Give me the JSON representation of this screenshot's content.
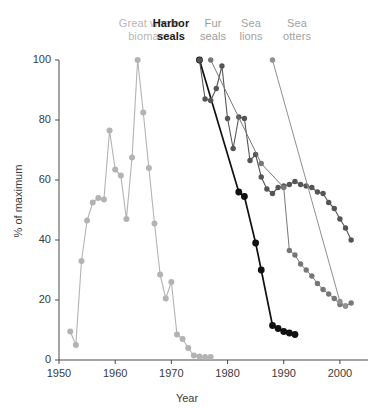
{
  "chart_data": {
    "type": "line",
    "title": "",
    "xlabel": "Year",
    "ylabel": "% of maximum",
    "xlim": [
      1950,
      2005
    ],
    "ylim": [
      0,
      100
    ],
    "xticks": [
      1950,
      1960,
      1970,
      1980,
      1990,
      2000
    ],
    "yticks": [
      0,
      20,
      40,
      60,
      80,
      100
    ],
    "grid": false,
    "legend_position": "top-inside",
    "series": [
      {
        "name": "Great whale biomass",
        "color": "#b3b3b3",
        "label_color": "#b3b3b3",
        "points": [
          [
            1952,
            9.5
          ],
          [
            1953,
            5.0
          ],
          [
            1954,
            33.0
          ],
          [
            1955,
            46.5
          ],
          [
            1956,
            52.5
          ],
          [
            1957,
            54.0
          ],
          [
            1958,
            53.5
          ],
          [
            1959,
            76.5
          ],
          [
            1960,
            63.5
          ],
          [
            1961,
            61.5
          ],
          [
            1962,
            47.0
          ],
          [
            1963,
            67.5
          ],
          [
            1964,
            100.0
          ],
          [
            1965,
            82.5
          ],
          [
            1966,
            64.0
          ],
          [
            1967,
            45.5
          ],
          [
            1968,
            28.5
          ],
          [
            1969,
            20.5
          ],
          [
            1970,
            26.0
          ],
          [
            1971,
            8.5
          ],
          [
            1972,
            7.0
          ],
          [
            1973,
            4.0
          ],
          [
            1974,
            1.5
          ],
          [
            1975,
            1.2
          ],
          [
            1976,
            1.0
          ],
          [
            1977,
            1.0
          ]
        ]
      },
      {
        "name": "Harbor seals",
        "color": "#111111",
        "label_color": "#1a1a1a",
        "points": [
          [
            1975,
            100.0
          ],
          [
            1982,
            56.0
          ],
          [
            1983,
            54.5
          ],
          [
            1985,
            39.0
          ],
          [
            1986,
            30.0
          ],
          [
            1988,
            11.5
          ],
          [
            1989,
            10.5
          ],
          [
            1990,
            9.5
          ],
          [
            1991,
            9.0
          ],
          [
            1992,
            8.5
          ]
        ]
      },
      {
        "name": "Fur seals",
        "color": "#555555",
        "label_color": "#9a9a9a",
        "points": [
          [
            1975,
            100.0
          ],
          [
            1976,
            87.0
          ],
          [
            1977,
            86.5
          ],
          [
            1978,
            90.5
          ],
          [
            1979,
            98.0
          ],
          [
            1980,
            80.5
          ],
          [
            1981,
            70.5
          ],
          [
            1982,
            81.0
          ],
          [
            1983,
            80.5
          ],
          [
            1984,
            66.5
          ],
          [
            1985,
            68.5
          ],
          [
            1986,
            61.0
          ],
          [
            1987,
            57.0
          ],
          [
            1988,
            55.5
          ],
          [
            1989,
            57.5
          ],
          [
            1990,
            58.0
          ],
          [
            1991,
            58.5
          ],
          [
            1992,
            59.5
          ],
          [
            1993,
            58.5
          ],
          [
            1994,
            58.0
          ],
          [
            1995,
            57.5
          ],
          [
            1996,
            56.0
          ],
          [
            1997,
            55.5
          ],
          [
            1998,
            52.5
          ],
          [
            1999,
            50.5
          ],
          [
            2000,
            47.0
          ],
          [
            2001,
            44.0
          ],
          [
            2002,
            40.0
          ]
        ]
      },
      {
        "name": "Sea lions",
        "color": "#777777",
        "label_color": "#a6a6a6",
        "points": [
          [
            1977,
            100.0
          ],
          [
            1986,
            65.5
          ],
          [
            1990,
            57.5
          ],
          [
            1991,
            36.5
          ],
          [
            1992,
            35.0
          ],
          [
            1993,
            32.0
          ],
          [
            1994,
            30.0
          ],
          [
            1995,
            28.0
          ],
          [
            1996,
            25.5
          ],
          [
            1997,
            23.5
          ],
          [
            1998,
            22.0
          ],
          [
            1999,
            20.5
          ],
          [
            2000,
            18.5
          ],
          [
            2001,
            18.0
          ],
          [
            2002,
            19.0
          ]
        ]
      },
      {
        "name": "Sea otters",
        "color": "#8f8f8f",
        "label_color": "#a6a6a6",
        "points": [
          [
            1988,
            100.0
          ],
          [
            2000,
            19.5
          ],
          [
            2001,
            18.0
          ]
        ]
      }
    ]
  },
  "legend": [
    {
      "id": "great-whale-biomass",
      "text": "Great whale\nbiomass",
      "x": 112,
      "y": 17,
      "width": 74,
      "color": "#b6b6b6",
      "bold": false
    },
    {
      "id": "harbor-seals",
      "text": "Harbor\nseals",
      "x": 143,
      "y": 17,
      "width": 56,
      "color": "#1a1a1a",
      "bold": true
    },
    {
      "id": "fur-seals",
      "text": "Fur\nseals",
      "x": 190,
      "y": 17,
      "width": 46,
      "color": "#9b9b9b",
      "bold": false
    },
    {
      "id": "sea-lions",
      "text": "Sea\nlions",
      "x": 229,
      "y": 17,
      "width": 44,
      "color": "#a2a2a2",
      "bold": false
    },
    {
      "id": "sea-otters",
      "text": "Sea\notters",
      "x": 272,
      "y": 17,
      "width": 50,
      "color": "#a2a2a2",
      "bold": false
    }
  ],
  "axes": {
    "x_tick_labels": [
      "1950",
      "1960",
      "1970",
      "1980",
      "1990",
      "2000"
    ],
    "y_tick_labels": [
      "0",
      "20",
      "40",
      "60",
      "80",
      "100"
    ],
    "x_title": "Year",
    "y_title": "% of maximum"
  }
}
